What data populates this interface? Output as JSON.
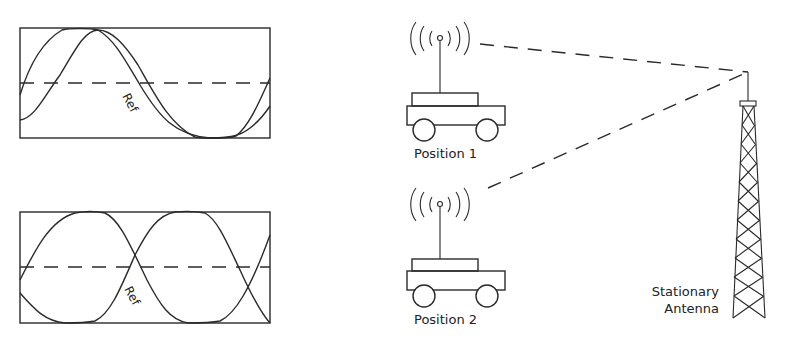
{
  "diagram": {
    "title": "",
    "waveforms": [
      {
        "id": "top",
        "ref_label": "Ref",
        "phase_relation": "signals offset in phase (partially overlapping peaks)"
      },
      {
        "id": "bottom",
        "ref_label": "Ref",
        "phase_relation": "signals roughly in opposite phase"
      }
    ],
    "vehicles": [
      {
        "id": "position-1",
        "label": "Position 1"
      },
      {
        "id": "position-2",
        "label": "Position 2"
      }
    ],
    "antenna": {
      "label_line1": "Stationary",
      "label_line2": "Antenna"
    },
    "colors": {
      "ink": "#2a2a2a",
      "background": "#ffffff"
    }
  }
}
